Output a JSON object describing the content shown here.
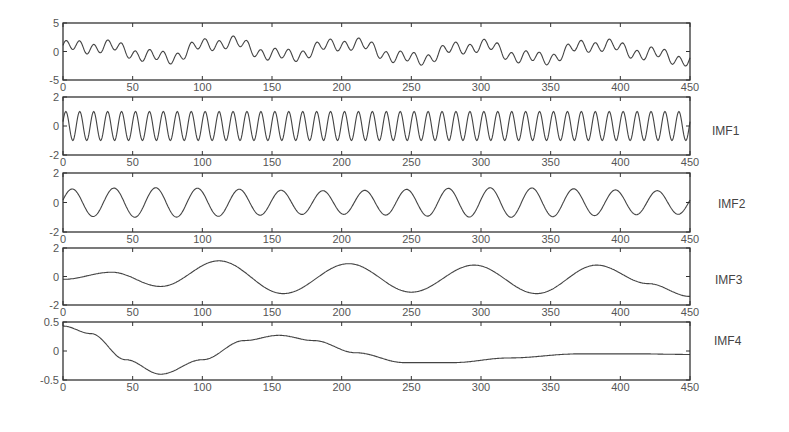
{
  "figure": {
    "type": "stacked-subplots"
  },
  "chart_data": [
    {
      "type": "line",
      "title": "",
      "label": "",
      "xlabel": "",
      "ylabel": "",
      "xlim": [
        0,
        450
      ],
      "ylim": [
        -5,
        5
      ],
      "xticks": [
        "0",
        "50",
        "100",
        "150",
        "200",
        "250",
        "300",
        "350",
        "400",
        "450"
      ],
      "yticks": [
        "5",
        "0",
        "-5"
      ],
      "grid": false,
      "model": "sum of IMF1..IMF4 (original signal)",
      "box": {
        "top": 23,
        "bottom": 80
      }
    },
    {
      "type": "line",
      "label": "IMF1",
      "xlim": [
        0,
        450
      ],
      "ylim": [
        -2,
        2
      ],
      "xticks": [
        "0",
        "50",
        "100",
        "150",
        "200",
        "250",
        "300",
        "350",
        "400",
        "450"
      ],
      "yticks": [
        "2",
        "0",
        "-2"
      ],
      "grid": false,
      "model": {
        "amplitude": 1.0,
        "period": 10
      },
      "box": {
        "top": 97,
        "bottom": 155
      },
      "label_pos": {
        "x": 712,
        "y": 124
      }
    },
    {
      "type": "line",
      "label": "IMF2",
      "xlim": [
        0,
        450
      ],
      "ylim": [
        -2,
        2
      ],
      "xticks": [
        "0",
        "50",
        "100",
        "150",
        "200",
        "250",
        "300",
        "350",
        "400",
        "450"
      ],
      "yticks": [
        "2",
        "0",
        "-2"
      ],
      "grid": false,
      "model": {
        "amplitude": 1.0,
        "period": 30
      },
      "box": {
        "top": 173,
        "bottom": 232
      },
      "label_pos": {
        "x": 718,
        "y": 197
      }
    },
    {
      "type": "line",
      "label": "IMF3",
      "xlim": [
        0,
        450
      ],
      "ylim": [
        -2,
        2
      ],
      "xticks": [
        "0",
        "50",
        "100",
        "150",
        "200",
        "250",
        "300",
        "350",
        "400",
        "450"
      ],
      "yticks": [
        "2",
        "0",
        "-2"
      ],
      "grid": false,
      "points": [
        [
          0,
          -0.2
        ],
        [
          35,
          0.3
        ],
        [
          70,
          -0.7
        ],
        [
          112,
          1.1
        ],
        [
          158,
          -1.2
        ],
        [
          205,
          0.9
        ],
        [
          250,
          -1.1
        ],
        [
          295,
          0.8
        ],
        [
          340,
          -1.2
        ],
        [
          383,
          0.8
        ],
        [
          420,
          -0.5
        ],
        [
          450,
          -1.4
        ]
      ],
      "box": {
        "top": 248,
        "bottom": 305
      },
      "label_pos": {
        "x": 715,
        "y": 273
      }
    },
    {
      "type": "line",
      "label": "IMF4",
      "xlim": [
        0,
        450
      ],
      "ylim": [
        -0.5,
        0.5
      ],
      "xticks": [
        "0",
        "50",
        "100",
        "150",
        "200",
        "250",
        "300",
        "350",
        "400",
        "450"
      ],
      "yticks": [
        "0.5",
        "0",
        "-0.5"
      ],
      "grid": false,
      "points": [
        [
          0,
          0.43
        ],
        [
          20,
          0.3
        ],
        [
          45,
          -0.15
        ],
        [
          70,
          -0.4
        ],
        [
          100,
          -0.15
        ],
        [
          130,
          0.18
        ],
        [
          155,
          0.27
        ],
        [
          180,
          0.18
        ],
        [
          210,
          -0.03
        ],
        [
          245,
          -0.2
        ],
        [
          280,
          -0.2
        ],
        [
          320,
          -0.12
        ],
        [
          370,
          -0.05
        ],
        [
          415,
          -0.05
        ],
        [
          450,
          -0.06
        ]
      ],
      "box": {
        "top": 322,
        "bottom": 380
      },
      "label_pos": {
        "x": 714,
        "y": 334
      }
    }
  ],
  "layout": {
    "left": 63,
    "right": 690,
    "axis_color": "#333333",
    "line_color": "#444444",
    "tick_text_color": "#555555"
  }
}
